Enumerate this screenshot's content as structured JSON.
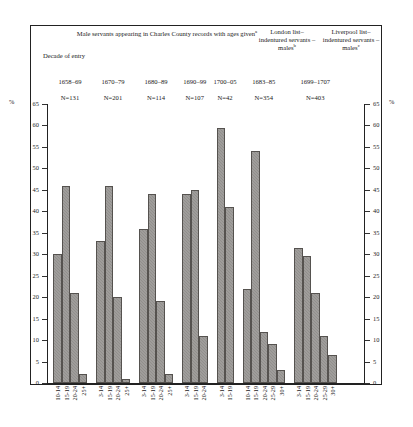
{
  "header": {
    "main_title": "Male servants appearing in Charles County records with ages given",
    "main_title_note": "a",
    "london_title": "London list– indentured servants – males",
    "london_note": "b",
    "liverpool_title": "Liverpool list– indentured servants – males",
    "liverpool_note": "c",
    "decade_label": "Decade of entry"
  },
  "axis": {
    "percent_symbol_left": "%",
    "percent_symbol_right": "%",
    "yticks": [
      "0",
      "5",
      "10",
      "15",
      "20",
      "25",
      "30",
      "35",
      "40",
      "45",
      "50",
      "55",
      "60",
      "65"
    ]
  },
  "chart_data": {
    "type": "bar",
    "title": "Male servants appearing in Charles County records with ages given",
    "xlabel": "",
    "ylabel": "%",
    "ylim": [
      0,
      65
    ],
    "grid": false,
    "legend_position": "none",
    "groups": [
      {
        "label": "1658–69",
        "n_label": "N=131",
        "n": 131,
        "categories": [
          "10-14",
          "15-19",
          "20-24",
          "25+"
        ],
        "values": [
          30,
          46,
          21,
          2
        ]
      },
      {
        "label": "1670–79",
        "n_label": "N=201",
        "n": 201,
        "categories": [
          "3-14",
          "15-19",
          "20-24",
          "25+"
        ],
        "values": [
          33,
          46,
          20,
          1
        ]
      },
      {
        "label": "1680–89",
        "n_label": "N=114",
        "n": 114,
        "categories": [
          "3-14",
          "15-19",
          "20-24",
          "25+"
        ],
        "values": [
          36,
          44,
          19,
          2
        ]
      },
      {
        "label": "1690–99",
        "n_label": "N=107",
        "n": 107,
        "categories": [
          "3-14",
          "15-19",
          "20-24"
        ],
        "values": [
          44,
          45,
          11
        ]
      },
      {
        "label": "1700–05",
        "n_label": "N=42",
        "n": 42,
        "categories": [
          "3-14",
          "15-19"
        ],
        "values": [
          59.5,
          41
        ]
      },
      {
        "label": "1683–85",
        "n_label": "N=354",
        "n": 354,
        "categories": [
          "10-14",
          "15-19",
          "20-24",
          "25-29",
          "30+"
        ],
        "values": [
          22,
          54,
          12,
          9,
          3
        ]
      },
      {
        "label": "1699–1707",
        "n_label": "N=403",
        "n": 403,
        "categories": [
          "3-14",
          "15-19",
          "20-24",
          "25-29",
          "30+"
        ],
        "values": [
          31.5,
          29.5,
          21,
          11,
          6.5
        ]
      }
    ]
  },
  "colors": {
    "bar_fill": "#918f8c",
    "bar_stroke": "#55524f",
    "frame": "#222222",
    "text": "#1a1a1a"
  }
}
